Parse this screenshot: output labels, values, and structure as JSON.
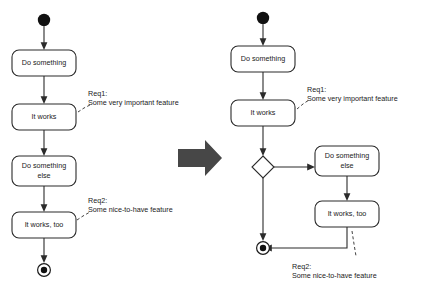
{
  "diagram": {
    "colors": {
      "stroke": "#2b2b2b",
      "fill": "#ffffff",
      "text": "#1a1a1a",
      "node_solid": "#111111",
      "transform_arrow": "#474747",
      "background": "#ffffff"
    },
    "transform_arrow": {
      "icon": "thick-right-arrow-icon",
      "direction": "right"
    },
    "left": {
      "name": "before-diagram",
      "nodes": [
        {
          "id": "start",
          "type": "initial-node",
          "label": ""
        },
        {
          "id": "a1",
          "type": "activity",
          "label": "Do something"
        },
        {
          "id": "a2",
          "type": "activity",
          "label": "It works"
        },
        {
          "id": "a3",
          "type": "activity",
          "label": "Do something",
          "label2": "else"
        },
        {
          "id": "a4",
          "type": "activity",
          "label": "It works, too"
        },
        {
          "id": "end",
          "type": "final-node",
          "label": ""
        }
      ],
      "annotations": [
        {
          "id": "req1",
          "title": "Req1:",
          "text": "Some very important feature",
          "attached_to": "a2"
        },
        {
          "id": "req2",
          "title": "Req2:",
          "text": "Some nice-to-have feature",
          "attached_to": "a4"
        }
      ]
    },
    "right": {
      "name": "after-diagram",
      "nodes": [
        {
          "id": "start",
          "type": "initial-node",
          "label": ""
        },
        {
          "id": "b1",
          "type": "activity",
          "label": "Do something"
        },
        {
          "id": "b2",
          "type": "activity",
          "label": "It works"
        },
        {
          "id": "d1",
          "type": "decision-node",
          "label": ""
        },
        {
          "id": "b3",
          "type": "activity",
          "label": "Do something",
          "label2": "else"
        },
        {
          "id": "b4",
          "type": "activity",
          "label": "It works, too"
        },
        {
          "id": "end",
          "type": "final-node",
          "label": ""
        }
      ],
      "annotations": [
        {
          "id": "req1",
          "title": "Req1:",
          "text": "Some very important feature",
          "attached_to": "b2"
        },
        {
          "id": "req2",
          "title": "Req2:",
          "text": "Some nice-to-have feature",
          "attached_to": "b4"
        }
      ]
    }
  }
}
